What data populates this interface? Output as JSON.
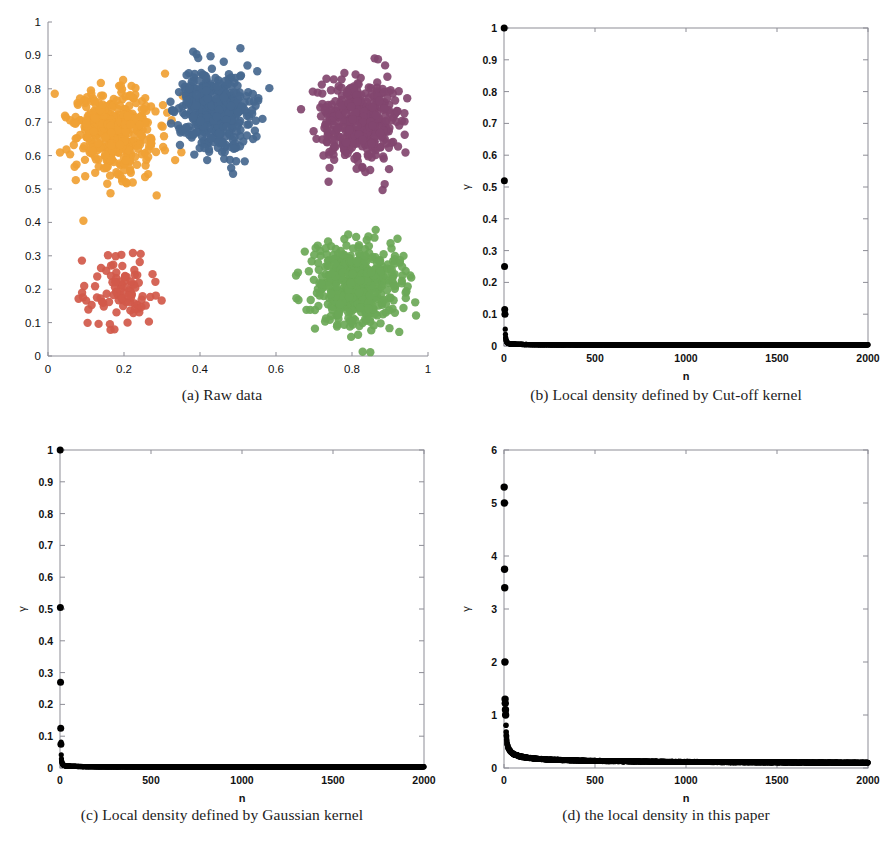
{
  "figure": {
    "title": "",
    "panel_count": 4
  },
  "panels": [
    {
      "id": "a",
      "caption": "(a) Raw data",
      "chart_ref": 0
    },
    {
      "id": "b",
      "caption": "(b) Local density defined by Cut-off kernel",
      "chart_ref": 1
    },
    {
      "id": "c",
      "caption": "(c) Local density defined by Gaussian kernel",
      "chart_ref": 2
    },
    {
      "id": "d",
      "caption": "(d) the local density in this paper",
      "chart_ref": 3
    }
  ],
  "chart_data": [
    {
      "type": "scatter",
      "title": "",
      "xlabel": "",
      "ylabel": "",
      "xlim": [
        0,
        1
      ],
      "ylim": [
        0,
        1
      ],
      "xticks": [
        "0",
        "0.2",
        "0.4",
        "0.6",
        "0.8",
        "1"
      ],
      "xtick_values": [
        0,
        0.2,
        0.4,
        0.6,
        0.8,
        1
      ],
      "yticks": [
        "0",
        "0.1",
        "0.2",
        "0.3",
        "0.4",
        "0.5",
        "0.6",
        "0.7",
        "0.8",
        "0.9",
        "1"
      ],
      "ytick_values": [
        0,
        0.1,
        0.2,
        0.3,
        0.4,
        0.5,
        0.6,
        0.7,
        0.8,
        0.9,
        1
      ],
      "grid": false,
      "legend": "none",
      "marker_size": 4.2,
      "series": [
        {
          "name": "cluster-orange",
          "color": "#F0A134",
          "n_points": 420,
          "center": [
            0.175,
            0.665
          ],
          "spread": [
            0.055,
            0.062
          ]
        },
        {
          "name": "cluster-blue",
          "color": "#46688F",
          "n_points": 430,
          "center": [
            0.44,
            0.725
          ],
          "spread": [
            0.048,
            0.062
          ]
        },
        {
          "name": "cluster-purple",
          "color": "#82466F",
          "n_points": 390,
          "center": [
            0.815,
            0.705
          ],
          "spread": [
            0.055,
            0.065
          ]
        },
        {
          "name": "cluster-red",
          "color": "#D1594A",
          "n_points": 95,
          "center": [
            0.185,
            0.185
          ],
          "spread": [
            0.048,
            0.055
          ]
        },
        {
          "name": "cluster-green",
          "color": "#6BA857",
          "n_points": 520,
          "center": [
            0.81,
            0.215
          ],
          "spread": [
            0.058,
            0.062
          ]
        }
      ]
    },
    {
      "type": "scatter",
      "title": "",
      "xlabel": "n",
      "ylabel": "γ",
      "xlim": [
        0,
        2000
      ],
      "ylim": [
        0,
        1
      ],
      "xticks": [
        "0",
        "500",
        "1000",
        "1500",
        "2000"
      ],
      "xtick_values": [
        0,
        500,
        1000,
        1500,
        2000
      ],
      "yticks": [
        "0",
        "0.1",
        "0.2",
        "0.3",
        "0.4",
        "0.5",
        "0.6",
        "0.7",
        "0.8",
        "0.9",
        "1"
      ],
      "ytick_values": [
        0,
        0.1,
        0.2,
        0.3,
        0.4,
        0.5,
        0.6,
        0.7,
        0.8,
        0.9,
        1
      ],
      "grid": false,
      "legend": "none",
      "marker_color": "#000000",
      "marker_size": 2.6,
      "outliers": [
        {
          "n": 1,
          "gamma": 1.0
        },
        {
          "n": 2,
          "gamma": 0.52
        },
        {
          "n": 3,
          "gamma": 0.25
        },
        {
          "n": 4,
          "gamma": 0.115
        },
        {
          "n": 5,
          "gamma": 0.1
        }
      ],
      "decay": {
        "model": "power",
        "amplitude": 0.1,
        "exponent": 1.05,
        "floor": 0.004,
        "n_points": 2000
      }
    },
    {
      "type": "scatter",
      "title": "",
      "xlabel": "n",
      "ylabel": "γ",
      "xlim": [
        0,
        2000
      ],
      "ylim": [
        0,
        1
      ],
      "xticks": [
        "0",
        "500",
        "1000",
        "1500",
        "2000"
      ],
      "xtick_values": [
        0,
        500,
        1000,
        1500,
        2000
      ],
      "yticks": [
        "0",
        "0.1",
        "0.2",
        "0.3",
        "0.4",
        "0.5",
        "0.6",
        "0.7",
        "0.8",
        "0.9",
        "1"
      ],
      "ytick_values": [
        0,
        0.1,
        0.2,
        0.3,
        0.4,
        0.5,
        0.6,
        0.7,
        0.8,
        0.9,
        1
      ],
      "grid": false,
      "legend": "none",
      "marker_color": "#000000",
      "marker_size": 2.6,
      "outliers": [
        {
          "n": 1,
          "gamma": 1.0
        },
        {
          "n": 2,
          "gamma": 0.505
        },
        {
          "n": 3,
          "gamma": 0.27
        },
        {
          "n": 4,
          "gamma": 0.125
        },
        {
          "n": 5,
          "gamma": 0.075
        }
      ],
      "decay": {
        "model": "power",
        "amplitude": 0.075,
        "exponent": 1.0,
        "floor": 0.004,
        "n_points": 2000
      }
    },
    {
      "type": "scatter",
      "title": "",
      "xlabel": "n",
      "ylabel": "γ",
      "xlim": [
        0,
        2000
      ],
      "ylim": [
        0,
        6
      ],
      "xticks": [
        "0",
        "500",
        "1000",
        "1500",
        "2000"
      ],
      "xtick_values": [
        0,
        500,
        1000,
        1500,
        2000
      ],
      "yticks": [
        "0",
        "1",
        "2",
        "3",
        "4",
        "5",
        "6"
      ],
      "ytick_values": [
        0,
        1,
        2,
        3,
        4,
        5,
        6
      ],
      "grid": false,
      "legend": "none",
      "marker_color": "#000000",
      "marker_size": 2.8,
      "outliers": [
        {
          "n": 1,
          "gamma": 5.3
        },
        {
          "n": 2,
          "gamma": 5.0
        },
        {
          "n": 3,
          "gamma": 3.75
        },
        {
          "n": 4,
          "gamma": 3.4
        },
        {
          "n": 5,
          "gamma": 2.0
        },
        {
          "n": 6,
          "gamma": 1.3
        },
        {
          "n": 7,
          "gamma": 1.22
        },
        {
          "n": 8,
          "gamma": 1.1
        },
        {
          "n": 9,
          "gamma": 1.0
        }
      ],
      "decay": {
        "model": "power",
        "amplitude": 1.0,
        "exponent": 0.42,
        "floor": 0.06,
        "n_points": 2000
      }
    }
  ]
}
